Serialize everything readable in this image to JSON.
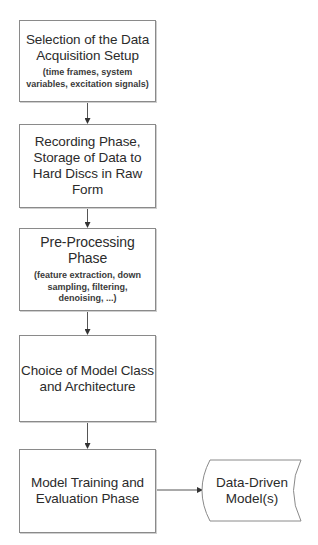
{
  "diagram": {
    "type": "flowchart",
    "direction": "top-to-bottom",
    "steps": [
      {
        "id": "step1",
        "title": "Selection of the Data Acquisition Setup",
        "title_lines": [
          "Selection of the Data",
          "Acquisition Setup"
        ],
        "detail": "(time frames, system variables, excitation signals)"
      },
      {
        "id": "step2",
        "title": "Recording Phase, Storage of Data to Hard Discs in Raw Form",
        "title_lines": [
          "Recording Phase,",
          "Storage of Data to",
          "Hard Discs in Raw",
          "Form"
        ]
      },
      {
        "id": "step3",
        "title": "Pre-Processing Phase",
        "detail": "(feature extraction, down sampling, filtering, denoising, ...)"
      },
      {
        "id": "step4",
        "title": "Choice of Model Class and Architecture",
        "title_lines": [
          "Choice of Model Class",
          "and Architecture"
        ]
      },
      {
        "id": "step5",
        "title": "Model Training and Evaluation Phase",
        "title_lines": [
          "Model Training and",
          "Evaluation Phase"
        ]
      }
    ],
    "output": {
      "id": "output",
      "shape": "stored-data",
      "label": "Data-Driven Model(s)",
      "label_lines": [
        "Data-Driven",
        "Model(s)"
      ]
    },
    "edges": [
      {
        "from": "step1",
        "to": "step2"
      },
      {
        "from": "step2",
        "to": "step3"
      },
      {
        "from": "step3",
        "to": "step4"
      },
      {
        "from": "step4",
        "to": "step5"
      },
      {
        "from": "step5",
        "to": "output"
      }
    ],
    "colors": {
      "stroke": "#8a8a8a",
      "text": "#2b2b2b",
      "background": "#ffffff"
    }
  }
}
